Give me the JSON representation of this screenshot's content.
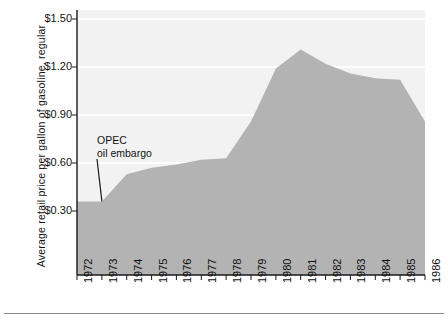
{
  "axes": {
    "ylabel": "Average retail price per gallon, regular",
    "ylabel_full": "Average retail price per gallon of gasoline, regular",
    "yticks": [
      "$1.50",
      "$1.20",
      "$0.90",
      "$0.60",
      "$0.30"
    ],
    "xticks": [
      "1972",
      "1973",
      "1974",
      "1975",
      "1976",
      "1977",
      "1978",
      "1979",
      "1980",
      "1981",
      "1982",
      "1983",
      "1984",
      "1985",
      "1986"
    ]
  },
  "annotation": {
    "line1": "OPEC",
    "line2": "oil embargo",
    "at_year": 1973
  },
  "colors": {
    "area_fill": "#b3b3b3",
    "plot_background": "#f2f2f2",
    "gridline": "#ffffff",
    "axis": "#1a1a1a",
    "text": "#111111"
  },
  "chart_data": {
    "type": "area",
    "title": "",
    "xlabel": "",
    "ylabel": "Average retail price per gallon of gasoline, regular",
    "x": [
      1972,
      1973,
      1974,
      1975,
      1976,
      1977,
      1978,
      1979,
      1980,
      1981,
      1982,
      1983,
      1984,
      1985,
      1986
    ],
    "values": [
      0.36,
      0.36,
      0.53,
      0.57,
      0.59,
      0.62,
      0.63,
      0.86,
      1.19,
      1.31,
      1.22,
      1.16,
      1.13,
      1.12,
      0.86
    ],
    "ylim": [
      0,
      1.6
    ],
    "xlim": [
      1972,
      1986
    ],
    "ytick_values": [
      1.5,
      1.2,
      0.9,
      0.6,
      0.3
    ],
    "grid": true,
    "legend": "none",
    "annotations": [
      {
        "text": "OPEC oil embargo",
        "x": 1973,
        "y": 0.36
      }
    ]
  }
}
